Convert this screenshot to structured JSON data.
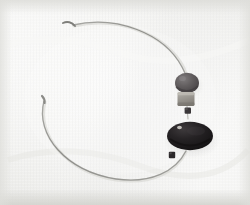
{
  "photo": {
    "subject": "wire-necklace-with-beads",
    "title": "Wire torc necklace with three beads",
    "background": {
      "base_color": "#f2f2f0",
      "highlight_color": "#fbfbfa",
      "shadow_color": "#e3e3e0",
      "edge_vignette_color": "#e6e6e3",
      "texture": "fine woven cloth"
    },
    "wire": {
      "label": "curved wire loop",
      "color": "#9a9a96",
      "highlight_color": "#c9c9c5",
      "thickness_px": 1.2,
      "shape": "open circular arc",
      "open_gap_side": "upper-left"
    },
    "wire_tips": [
      {
        "name": "upper-left-tip",
        "x": 72,
        "y": 24,
        "color": "#8e8e8a"
      },
      {
        "name": "lower-left-tip",
        "x": 43,
        "y": 101,
        "color": "#9b9b97"
      }
    ],
    "beads": [
      {
        "name": "round-dark-bead",
        "shape": "ellipse",
        "cx": 187,
        "cy": 83,
        "rx": 12,
        "ry": 10,
        "color": "#5f5b5c",
        "shade_color": "#474345",
        "highlight_color": "#7d797a"
      },
      {
        "name": "cube-light-bead",
        "shape": "rounded-square",
        "cx": 186,
        "cy": 99,
        "w": 17,
        "h": 14,
        "color": "#9f9c96",
        "shade_color": "#848079",
        "highlight_color": "#bab7b0"
      },
      {
        "name": "small-square-bead",
        "shape": "square",
        "cx": 188,
        "cy": 111,
        "w": 6,
        "h": 6,
        "color": "#3a3739"
      },
      {
        "name": "pendant-disc",
        "shape": "ellipse",
        "cx": 190,
        "cy": 136,
        "rx": 23,
        "ry": 14,
        "color": "#221f21",
        "shade_color": "#141213",
        "highlight_color": "#3e3a3c"
      },
      {
        "name": "small-clasp-bead",
        "shape": "square",
        "cx": 172,
        "cy": 155,
        "w": 6,
        "h": 6,
        "color": "#2c292b"
      }
    ],
    "specular_dots": [
      {
        "name": "pendant-highlight",
        "cx": 179,
        "cy": 127,
        "r": 2.2,
        "color": "#cfcbc6"
      },
      {
        "name": "round-bead-highlight",
        "cx": 183,
        "cy": 79,
        "r": 1.6,
        "color": "#8e8a8b"
      }
    ]
  }
}
